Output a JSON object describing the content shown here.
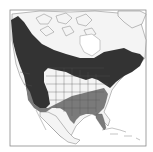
{
  "map": {
    "region": "North America",
    "legend": [
      {
        "name": "range-primary",
        "color": "#333333"
      },
      {
        "name": "range-winter",
        "color": "#7a7a7a"
      }
    ],
    "colors": {
      "background": "#ffffff",
      "land": "#f4f4f4",
      "range_dark": "#333333",
      "range_medium": "#7a7a7a",
      "borders": "#555555"
    }
  }
}
